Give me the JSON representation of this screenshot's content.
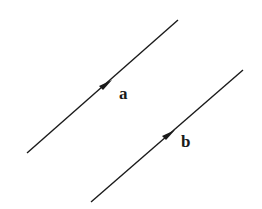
{
  "diagram": {
    "vectors": [
      {
        "label": "a",
        "color": "#1a1a1a"
      },
      {
        "label": "b",
        "color": "#1a1a1a"
      }
    ]
  }
}
